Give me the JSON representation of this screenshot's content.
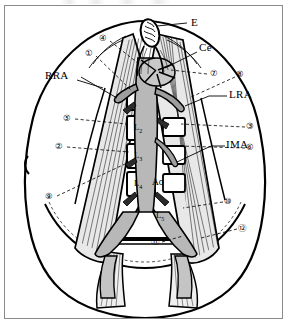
{
  "figure": {
    "frame_border_color": "#8a8a8a",
    "background_color": "#ffffff",
    "ink_color": "#000000",
    "fill_light_grey": "#d9d9d9",
    "fill_mid_grey": "#b5b5b5",
    "fill_dark_grey": "#8c8c8c"
  },
  "structure_labels": [
    {
      "id": "E",
      "text": "E",
      "x": 186,
      "y": 16,
      "kind": "text"
    },
    {
      "id": "Ce",
      "text": "Ce",
      "x": 194,
      "y": 41,
      "kind": "text"
    },
    {
      "id": "RRA",
      "text": "RRA",
      "x": 54,
      "y": 69,
      "kind": "text"
    },
    {
      "id": "LRA",
      "text": "LRA",
      "x": 225,
      "y": 88,
      "kind": "text"
    },
    {
      "id": "IMA",
      "text": "IMA",
      "x": 222,
      "y": 137,
      "kind": "text"
    },
    {
      "id": "Ao",
      "text": "Ao",
      "x": 150,
      "y": 177,
      "kind": "text"
    }
  ],
  "vertebra_labels": [
    {
      "id": "L2",
      "base": "L",
      "sub": "2",
      "x": 128,
      "y": 122
    },
    {
      "id": "L3",
      "base": "L",
      "sub": "3",
      "x": 128,
      "y": 150
    },
    {
      "id": "L4",
      "base": "L",
      "sub": "4",
      "x": 128,
      "y": 177
    },
    {
      "id": "L5",
      "base": "L",
      "sub": "5",
      "x": 152,
      "y": 210
    }
  ],
  "numbered_callouts": [
    {
      "n": 1,
      "glyph": "①",
      "x": 84,
      "y": 48
    },
    {
      "n": 2,
      "glyph": "②",
      "x": 54,
      "y": 140
    },
    {
      "n": 3,
      "glyph": "③",
      "x": 245,
      "y": 120
    },
    {
      "n": 4,
      "glyph": "④",
      "x": 98,
      "y": 33
    },
    {
      "n": 5,
      "glyph": "⑤",
      "x": 62,
      "y": 112
    },
    {
      "n": 6,
      "glyph": "⑥",
      "x": 245,
      "y": 141
    },
    {
      "n": 7,
      "glyph": "⑦",
      "x": 209,
      "y": 67
    },
    {
      "n": 8,
      "glyph": "⑧",
      "x": 235,
      "y": 68
    },
    {
      "n": 9,
      "glyph": "⑨",
      "x": 44,
      "y": 190
    },
    {
      "n": 10,
      "glyph": "⑩",
      "x": 223,
      "y": 195
    },
    {
      "n": 11,
      "glyph": "⑪",
      "x": 150,
      "y": 235
    },
    {
      "n": 12,
      "glyph": "⑫",
      "x": 237,
      "y": 222
    }
  ],
  "leader_lines": {
    "solid_count": 7,
    "dashed_count": 10,
    "note": "solid leaders for named structures, dashed leaders for numbered callouts"
  }
}
